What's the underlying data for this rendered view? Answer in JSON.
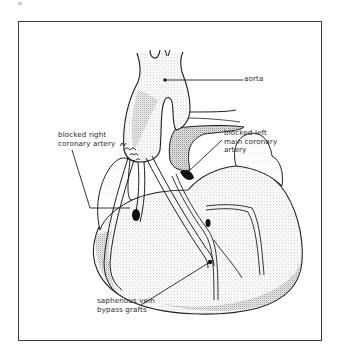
{
  "figure": {
    "labels": {
      "aorta": "aorta",
      "blocked_right": "blocked right\ncoronary artery",
      "blocked_left": "blocked left\nmain coronary\nartery",
      "bypass_grafts": "saphenous vein\nbypass grafts"
    },
    "colors": {
      "frame": "#3a3a3a",
      "ink": "#1f1f1f",
      "stipple_dark": "#9a9a9a",
      "stipple_light": "#d9d9d9",
      "background": "#ffffff"
    }
  }
}
